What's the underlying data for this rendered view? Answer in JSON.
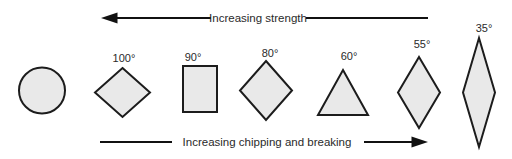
{
  "top_arrow": {
    "label": "Increasing strength",
    "direction": "left"
  },
  "bottom_arrow": {
    "label": "Increasing chipping and breaking",
    "direction": "right"
  },
  "shapes": [
    {
      "type": "circle",
      "angle_label": ""
    },
    {
      "type": "diamond",
      "angle_label": "100°"
    },
    {
      "type": "square",
      "angle_label": "90°"
    },
    {
      "type": "diamond",
      "angle_label": "80°"
    },
    {
      "type": "triangle",
      "angle_label": "60°"
    },
    {
      "type": "narrow-diamond",
      "angle_label": "55°"
    },
    {
      "type": "very-narrow-diamond",
      "angle_label": "35°"
    }
  ],
  "colors": {
    "shape_fill": "#e9e9e9",
    "shape_outline": "#1c1c1c",
    "arrow": "#111111",
    "text": "#2a2a2a",
    "background": "#ffffff"
  }
}
